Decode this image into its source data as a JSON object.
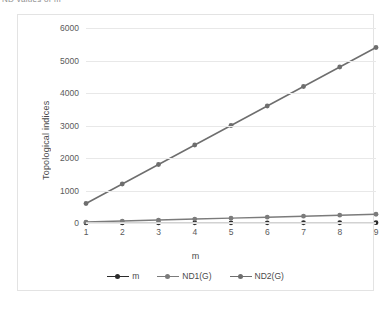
{
  "caption": {
    "text": "ND values of m"
  },
  "chart_data": {
    "type": "line",
    "title": "",
    "xlabel": "m",
    "ylabel": "Topological indices",
    "x": [
      1,
      2,
      3,
      4,
      5,
      6,
      7,
      8,
      9
    ],
    "categories": [
      "1",
      "2",
      "3",
      "4",
      "5",
      "6",
      "7",
      "8",
      "9"
    ],
    "series": [
      {
        "name": "m",
        "color": "#2b2b2b",
        "marker": "circle",
        "values": [
          1,
          2,
          3,
          4,
          5,
          6,
          7,
          8,
          9
        ]
      },
      {
        "name": "ND1(G)",
        "color": "#7b7b7b",
        "marker": "circle",
        "values": [
          30,
          60,
          90,
          120,
          150,
          180,
          210,
          240,
          270
        ]
      },
      {
        "name": "ND2(G)",
        "color": "#6e6e6e",
        "marker": "circle",
        "values": [
          600,
          1200,
          1800,
          2400,
          3000,
          3600,
          4200,
          4800,
          5400
        ]
      }
    ],
    "ylim": [
      0,
      6000
    ],
    "yticks": [
      0,
      1000,
      2000,
      3000,
      4000,
      5000,
      6000
    ],
    "ytick_labels": [
      "0",
      "1000",
      "2000",
      "3000",
      "4000",
      "5000",
      "6000"
    ],
    "xlim": [
      1,
      9
    ],
    "grid": "horizontal",
    "legend_position": "bottom",
    "legend": [
      "m",
      "ND1(G)",
      "ND2(G)"
    ],
    "plot_bg": "#ffffff",
    "gridline_color": "#e8e8e8",
    "border_color": "#e3e3e3"
  }
}
